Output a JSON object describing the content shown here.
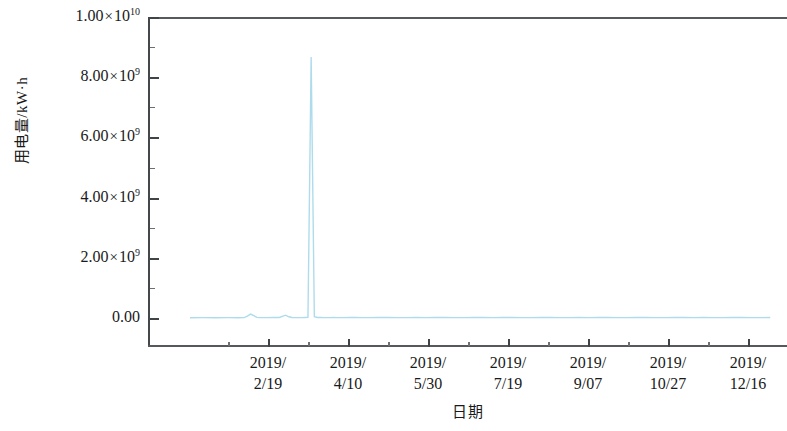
{
  "chart_data": {
    "type": "line",
    "title": "",
    "xlabel": "日期",
    "ylabel": "用电量/kW·h",
    "ylim": [
      0,
      10000000000
    ],
    "xlim": [
      "2019/01/01",
      "2019/12/31"
    ],
    "grid": false,
    "legend": null,
    "line_color": "#aedcec",
    "y_ticks": [
      {
        "value": 0,
        "label_mantissa": "0.00",
        "label_exp": null
      },
      {
        "value": 2000000000,
        "label_mantissa": "2.00",
        "label_exp": "9"
      },
      {
        "value": 4000000000,
        "label_mantissa": "4.00",
        "label_exp": "9"
      },
      {
        "value": 6000000000,
        "label_mantissa": "6.00",
        "label_exp": "9"
      },
      {
        "value": 8000000000,
        "label_mantissa": "8.00",
        "label_exp": "9"
      },
      {
        "value": 10000000000,
        "label_mantissa": "1.00",
        "label_exp": "10"
      }
    ],
    "x_ticks": [
      {
        "line1": "2019/",
        "line2": "2/19"
      },
      {
        "line1": "2019/",
        "line2": "4/10"
      },
      {
        "line1": "2019/",
        "line2": "5/30"
      },
      {
        "line1": "2019/",
        "line2": "7/19"
      },
      {
        "line1": "2019/",
        "line2": "9/07"
      },
      {
        "line1": "2019/",
        "line2": "10/27"
      },
      {
        "line1": "2019/",
        "line2": "12/16"
      }
    ],
    "series": [
      {
        "name": "用电量",
        "x_index": [
          0,
          8,
          16,
          24,
          30,
          34,
          36,
          38,
          40,
          42,
          44,
          48,
          52,
          56,
          60,
          62,
          64,
          66,
          68,
          70,
          72,
          74,
          76,
          78,
          80,
          82,
          84,
          86,
          88,
          90,
          92,
          96,
          100,
          104,
          108,
          112,
          118,
          124,
          130,
          136,
          142,
          148,
          154,
          160,
          166,
          172,
          178,
          184,
          190,
          196,
          202,
          208,
          214,
          220,
          226,
          232,
          238,
          244,
          250,
          256,
          262,
          268,
          274,
          280,
          286,
          292,
          298,
          304,
          310,
          316,
          322,
          328,
          334,
          340,
          346,
          352,
          358,
          364
        ],
        "values": [
          9000000,
          11000000,
          8000000,
          12000000,
          10000000,
          14000000,
          60000000,
          130000000,
          75000000,
          20000000,
          12000000,
          14000000,
          16000000,
          18000000,
          95000000,
          40000000,
          15000000,
          13000000,
          12000000,
          14000000,
          16000000,
          20000000,
          8670000000,
          42000000,
          18000000,
          15000000,
          13000000,
          14000000,
          12000000,
          15000000,
          13000000,
          14000000,
          16000000,
          15000000,
          14000000,
          13000000,
          15000000,
          16000000,
          14000000,
          13000000,
          15000000,
          14000000,
          16000000,
          15000000,
          13000000,
          14000000,
          16000000,
          15000000,
          14000000,
          16000000,
          15000000,
          13000000,
          14000000,
          15000000,
          16000000,
          14000000,
          13000000,
          15000000,
          14000000,
          16000000,
          15000000,
          13000000,
          14000000,
          16000000,
          15000000,
          14000000,
          13000000,
          15000000,
          16000000,
          14000000,
          15000000,
          13000000,
          14000000,
          16000000,
          15000000,
          14000000,
          13000000,
          15000000
        ]
      }
    ],
    "annotations": {
      "peak_value": 8670000000,
      "peak_x_label": "2019/2/19"
    }
  }
}
